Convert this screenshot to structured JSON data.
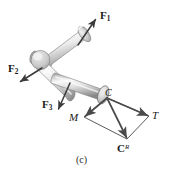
{
  "figure": {
    "caption": "(c)",
    "kind": "free-body-diagram-cranked-shaft",
    "background_color": "#ffffff",
    "body_color": "#d6d6d6",
    "body_highlight_color": "#fbfbfb",
    "body_shadow_color": "#9a9a9a",
    "outline_color": "#6f6f6f",
    "vector_color": "#3a3a3a"
  },
  "labels": {
    "f1": {
      "base": "F",
      "sub": "1"
    },
    "f2": {
      "base": "F",
      "sub": "2"
    },
    "f3": {
      "base": "F",
      "sub": "3"
    },
    "moment": "M",
    "torque": "T",
    "resultant": {
      "base": "C",
      "sup": "R"
    },
    "point_c": "C"
  },
  "vectors": [
    {
      "name": "F1",
      "label": "F1",
      "tail": [
        78,
        45
      ],
      "head": [
        96,
        19
      ],
      "style": "bold-force"
    },
    {
      "name": "F2",
      "label": "F2",
      "tail": [
        42,
        68
      ],
      "head": [
        20,
        82
      ],
      "style": "bold-force"
    },
    {
      "name": "F3",
      "label": "F3",
      "tail": [
        70,
        83
      ],
      "head": [
        58,
        110
      ],
      "style": "bold-force"
    },
    {
      "name": "M",
      "label": "M",
      "tail": [
        107,
        98
      ],
      "head": [
        84,
        117
      ],
      "style": "couple"
    },
    {
      "name": "T",
      "label": "T",
      "tail": [
        107,
        98
      ],
      "head": [
        149,
        116
      ],
      "style": "couple"
    },
    {
      "name": "CR",
      "label": "CR",
      "tail": [
        107,
        98
      ],
      "head": [
        127,
        139
      ],
      "style": "resultant"
    }
  ],
  "parallelogram": {
    "vertices": [
      [
        107,
        98
      ],
      [
        84,
        117
      ],
      [
        127,
        139
      ],
      [
        149,
        116
      ]
    ],
    "stroke": "#555555",
    "dashed": false
  }
}
